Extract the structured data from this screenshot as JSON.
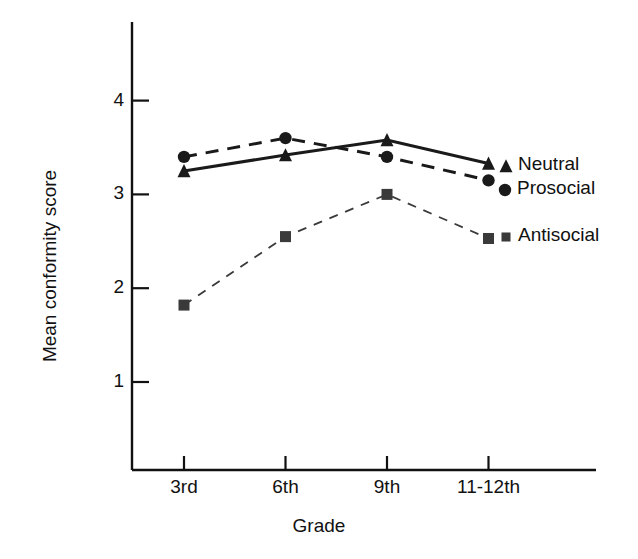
{
  "chart_data": {
    "type": "line",
    "title": "",
    "xlabel": "Grade",
    "ylabel": "Mean conformity score",
    "categories": [
      "3rd",
      "6th",
      "9th",
      "11-12th"
    ],
    "yticks": [
      "1",
      "2",
      "3",
      "4"
    ],
    "ytick_values": [
      1,
      2,
      3,
      4
    ],
    "ylim": [
      0.55,
      4.5
    ],
    "grid": false,
    "legend_position": "right-inline",
    "series": [
      {
        "name": "Neutral",
        "values": [
          3.25,
          3.42,
          3.58,
          3.33
        ],
        "marker": "triangle",
        "linestyle": "solid",
        "color": "#1a1a1a"
      },
      {
        "name": "Prosocial",
        "values": [
          3.4,
          3.6,
          3.4,
          3.15
        ],
        "marker": "circle",
        "linestyle": "dashed",
        "color": "#1a1a1a"
      },
      {
        "name": "Antisocial",
        "values": [
          1.82,
          2.55,
          3.0,
          2.53
        ],
        "marker": "square",
        "linestyle": "fine-dashed",
        "color": "#3a3a3a"
      }
    ]
  },
  "axes": {
    "y_axis_title": "Mean conformity score",
    "x_axis_title": "Grade"
  },
  "legend": {
    "items": [
      {
        "label": "Neutral",
        "marker": "triangle"
      },
      {
        "label": "Prosocial",
        "marker": "circle"
      },
      {
        "label": "Antisocial",
        "marker": "square"
      }
    ]
  }
}
